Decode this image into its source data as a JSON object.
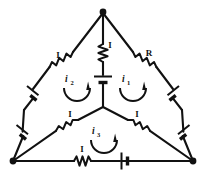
{
  "figure": {
    "name": "delta-mesh-circuit-diagram",
    "type": "schematic",
    "background_color": "#ffffff",
    "ink_color": "#111111",
    "width": 207,
    "height": 176
  },
  "labels": {
    "resistor_top_left": "I",
    "resistor_top_center": "I",
    "resistor_top_right": "R",
    "resistor_lower_left_inner": "I",
    "resistor_lower_right_inner": "I",
    "resistor_bottom": "I",
    "loop_right": "i",
    "loop_right_sub": "1",
    "loop_left": "i",
    "loop_left_sub": "2",
    "loop_bottom": "i",
    "loop_bottom_sub": "3"
  },
  "circuit": {
    "topology": "triangle with central star node",
    "nodes": [
      {
        "id": "apex",
        "x": 103,
        "y": 12,
        "marked": true
      },
      {
        "id": "bottom-left",
        "x": 13,
        "y": 161,
        "marked": true
      },
      {
        "id": "bottom-right",
        "x": 193,
        "y": 161,
        "marked": true
      },
      {
        "id": "center",
        "x": 103,
        "y": 107,
        "marked": false
      }
    ],
    "branches": [
      {
        "id": "apex-to-center",
        "from": "apex",
        "to": "center",
        "components": [
          "resistor",
          "battery"
        ],
        "label": "I"
      },
      {
        "id": "apex-to-bottom-left",
        "from": "apex",
        "to": "bottom-left",
        "components": [
          "resistor",
          "battery",
          "battery"
        ],
        "label": "I"
      },
      {
        "id": "apex-to-bottom-right",
        "from": "apex",
        "to": "bottom-right",
        "components": [
          "resistor",
          "battery",
          "battery"
        ],
        "label": "R"
      },
      {
        "id": "center-to-bottom-left",
        "from": "center",
        "to": "bottom-left",
        "components": [
          "resistor"
        ],
        "label": "I"
      },
      {
        "id": "center-to-bottom-right",
        "from": "center",
        "to": "bottom-right",
        "components": [
          "resistor"
        ],
        "label": "I"
      },
      {
        "id": "bottom-left-to-bottom-right",
        "from": "bottom-left",
        "to": "bottom-right",
        "components": [
          "resistor",
          "battery"
        ],
        "label": "I"
      }
    ],
    "mesh_loops": [
      {
        "id": "i1",
        "label": "i",
        "subscript": "1",
        "region": "right",
        "arrow_direction": "clockwise"
      },
      {
        "id": "i2",
        "label": "i",
        "subscript": "2",
        "region": "left",
        "arrow_direction": "clockwise"
      },
      {
        "id": "i3",
        "label": "i",
        "subscript": "3",
        "region": "bottom",
        "arrow_direction": "clockwise"
      }
    ]
  }
}
